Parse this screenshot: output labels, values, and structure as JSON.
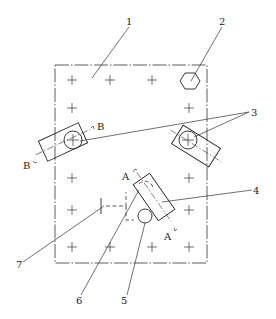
{
  "figure": {
    "type": "technical-drawing"
  },
  "callouts": [
    {
      "id": "1",
      "label": "1",
      "target": "plate"
    },
    {
      "id": "2",
      "label": "2",
      "target": "hexagon-nut"
    },
    {
      "id": "3",
      "label": "3",
      "target": "clamp-assemblies"
    },
    {
      "id": "4",
      "label": "4",
      "target": "angled-clamp"
    },
    {
      "id": "5",
      "label": "5",
      "target": "round-pin"
    },
    {
      "id": "6",
      "label": "6",
      "target": "hidden-pin"
    },
    {
      "id": "7",
      "label": "7",
      "target": "dashed-stop"
    }
  ],
  "section_marks": {
    "b_upper": "B",
    "b_lower": "B",
    "a_upper": "A",
    "a_lower": "A"
  },
  "colors": {
    "line": "#222222",
    "background": "#ffffff"
  }
}
